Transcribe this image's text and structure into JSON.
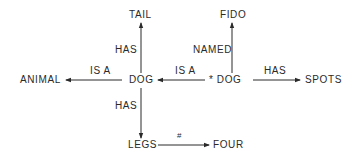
{
  "diagram": {
    "type": "semantic-network",
    "nodes": {
      "tail": "TAIL",
      "fido": "FIDO",
      "animal": "ANIMAL",
      "dog": "DOG",
      "dog_instance": "* DOG",
      "spots": "SPOTS",
      "legs": "LEGS",
      "four": "FOUR"
    },
    "edges": {
      "dog_tail": "HAS",
      "dog_animal": "IS A",
      "instance_dog": "IS A",
      "instance_fido": "NAMED",
      "instance_spots": "HAS",
      "dog_legs": "HAS",
      "legs_four": "#"
    },
    "colors": {
      "ink": "#2a2a2a",
      "background": "#ffffff"
    }
  }
}
